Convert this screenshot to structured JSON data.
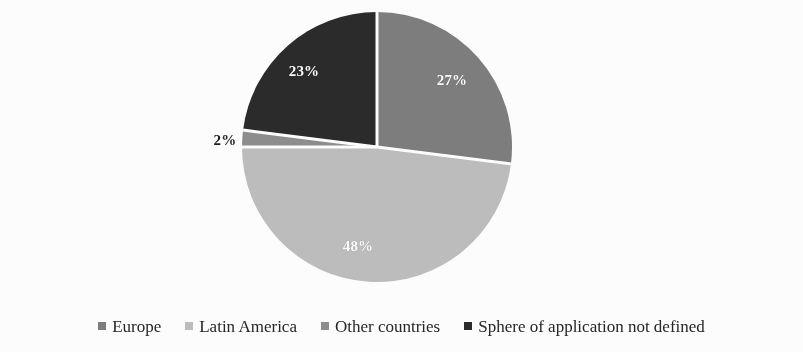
{
  "chart_data": {
    "type": "pie",
    "title": "",
    "subtitle": "",
    "xlabel": "",
    "ylabel": "",
    "grid": false,
    "legend_position": "bottom",
    "start_angle_deg": 0,
    "direction": "clockwise",
    "unit": "%",
    "categories": [
      "Europe",
      "Latin America",
      "Other countries",
      "Sphere of application not defined"
    ],
    "values": [
      27,
      48,
      2,
      23
    ],
    "labels": [
      "27%",
      "48%",
      "2%",
      "23%"
    ],
    "colors": [
      "#7e7e7e",
      "#bebebe",
      "#8f8f8f",
      "#2b2b2b"
    ],
    "slices": [
      {
        "category": "Europe",
        "value": 27,
        "label": "27%",
        "color": "#7e7e7e",
        "label_placement": "inside",
        "label_color": "#ffffff",
        "start_angle_deg": 0,
        "end_angle_deg": 97.2
      },
      {
        "category": "Latin America",
        "value": 48,
        "label": "48%",
        "color": "#bebebe",
        "label_placement": "inside",
        "label_color": "#ffffff",
        "start_angle_deg": 97.2,
        "end_angle_deg": 270.0
      },
      {
        "category": "Other countries",
        "value": 2,
        "label": "2%",
        "color": "#8f8f8f",
        "label_placement": "outside",
        "label_color": "#1d1d1d",
        "start_angle_deg": 270.0,
        "end_angle_deg": 277.2
      },
      {
        "category": "Sphere of application not defined",
        "value": 23,
        "label": "23%",
        "color": "#2b2b2b",
        "label_placement": "inside",
        "label_color": "#ffffff",
        "start_angle_deg": 277.2,
        "end_angle_deg": 360.0
      }
    ]
  },
  "geometry": {
    "center_x": 377,
    "center_y": 147,
    "radius": 135,
    "separator_color": "#ffffff",
    "separator_width": 3
  },
  "label_positions": [
    {
      "key": "label-27",
      "text": "27%",
      "x": 452,
      "y": 80,
      "placement": "inside"
    },
    {
      "key": "label-48",
      "text": "48%",
      "x": 358,
      "y": 246,
      "placement": "inside"
    },
    {
      "key": "label-2",
      "text": "2%",
      "x": 225,
      "y": 140,
      "placement": "outside"
    },
    {
      "key": "label-23",
      "text": "23%",
      "x": 304,
      "y": 71,
      "placement": "inside"
    }
  ],
  "legend": {
    "items": [
      {
        "label": "Europe",
        "color": "#7e7e7e"
      },
      {
        "label": "Latin America",
        "color": "#bebebe"
      },
      {
        "label": "Other countries",
        "color": "#8f8f8f"
      },
      {
        "label": "Sphere of application not defined",
        "color": "#2b2b2b"
      }
    ]
  }
}
